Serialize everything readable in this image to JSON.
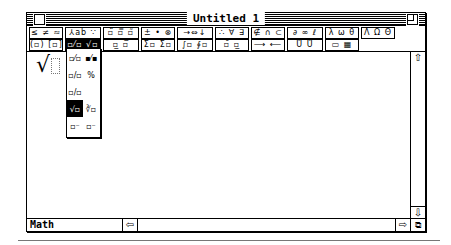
{
  "window": {
    "title": "Untitled 1"
  },
  "toolbar": {
    "row1": [
      {
        "label": "≤ ≠ ≈",
        "width": 34
      },
      {
        "label": "⅄ab ∵",
        "width": 36,
        "note": "spaces/accents"
      },
      {
        "label": "▫̈ ▫̿ ▫̃",
        "width": 36
      },
      {
        "label": "± • ⊗",
        "width": 34
      },
      {
        "label": "→⇔↓",
        "width": 36
      },
      {
        "label": "∴ ∀ ∃",
        "width": 34
      },
      {
        "label": "∉ ∩ ⊂",
        "width": 34
      },
      {
        "label": "∂ ∞ ℓ",
        "width": 36
      },
      {
        "label": "λ ω θ",
        "width": 34
      },
      {
        "label": "Λ Ω Θ",
        "width": 34
      }
    ],
    "row2": [
      {
        "label": "(▫) [▫]",
        "width": 34
      },
      {
        "label": "▫⁄▫ √▫",
        "width": 36,
        "selected": true
      },
      {
        "label": "▫̲ ▫̅",
        "width": 36
      },
      {
        "label": "Σ▫ Σ▫",
        "width": 34
      },
      {
        "label": "∫▫ ∮▫",
        "width": 36
      },
      {
        "label": "▫̄ ▫̲",
        "width": 34
      },
      {
        "label": "⟶ ⟵",
        "width": 34
      },
      {
        "label": "Ů Ů",
        "width": 36
      },
      {
        "label": "▭ ▦",
        "width": 34
      }
    ]
  },
  "popup": {
    "cells": [
      "▫⁄▫",
      "▪⁄▪",
      "▫/▫",
      "%",
      "▫/▫",
      "",
      "√▫",
      "∛▫",
      "▫⁻",
      "▫⁻"
    ],
    "selected_index": 6
  },
  "content": {
    "expression_radical": "√"
  },
  "statusbar": {
    "mode_label": "Math"
  },
  "scroll": {
    "up": "⇧",
    "down": "⇩",
    "left": "⇦",
    "right": "⇨",
    "grow": "⧉"
  }
}
